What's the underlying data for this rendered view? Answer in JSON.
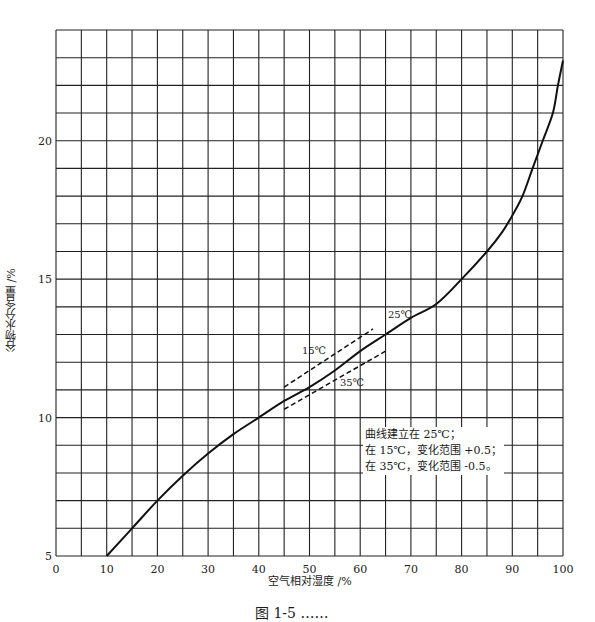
{
  "chart_data": {
    "type": "line",
    "title": "",
    "xlabel": "空气相对湿度 /%",
    "ylabel": "谷物水分含量 /%",
    "xlim": [
      0,
      100
    ],
    "ylim": [
      5,
      24
    ],
    "x_ticks": [
      0,
      10,
      20,
      30,
      40,
      50,
      60,
      70,
      80,
      90,
      100
    ],
    "y_ticks": [
      5,
      10,
      15,
      20
    ],
    "grid": {
      "on": true,
      "x_step": 5,
      "y_step": 1
    },
    "series": [
      {
        "name": "25℃",
        "style": "solid",
        "x": [
          10,
          15,
          20,
          25,
          30,
          35,
          40,
          45,
          50,
          55,
          60,
          65,
          70,
          75,
          80,
          85,
          88,
          90,
          92,
          94,
          96,
          98,
          99,
          100
        ],
        "y": [
          5.0,
          6.0,
          7.0,
          7.9,
          8.7,
          9.4,
          10.0,
          10.6,
          11.1,
          11.7,
          12.4,
          13.0,
          13.6,
          14.1,
          15.0,
          16.0,
          16.7,
          17.3,
          18.0,
          19.0,
          20.0,
          21.0,
          22.0,
          22.9
        ]
      },
      {
        "name": "15℃",
        "style": "dashed",
        "x": [
          45,
          62.5
        ],
        "y": [
          11.1,
          13.2
        ]
      },
      {
        "name": "35℃",
        "style": "dashed",
        "x": [
          45,
          65
        ],
        "y": [
          10.3,
          12.4
        ]
      }
    ],
    "annotations": [
      {
        "text": "15℃",
        "x": 49,
        "y": 12.2
      },
      {
        "text": "25℃",
        "x": 65,
        "y": 13.4
      },
      {
        "text": "35℃",
        "x": 55,
        "y": 11.1
      }
    ],
    "note_lines": [
      "曲线建立在 25℃；",
      "在 15℃，变化范围 +0.5；",
      "在 35℃，变化范围 -0.5。"
    ]
  },
  "labels": {
    "xlabel": "空气相对湿度 /%",
    "ylabel": "谷物水分含量 /%",
    "note": [
      "曲线建立在 25℃；",
      "在 15℃，变化范围 +0.5；",
      "在 35℃，变化范围 -0.5。"
    ],
    "temp_15": "15℃",
    "temp_25": "25℃",
    "temp_35": "35℃",
    "caption": "图 1-5  ……"
  },
  "colors": {
    "line": "#111111",
    "grid": "#222222",
    "background": "#ffffff"
  }
}
